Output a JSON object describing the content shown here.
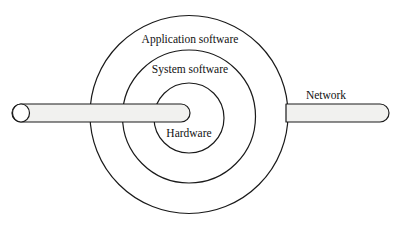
{
  "figure": {
    "type": "concentric-layer-diagram",
    "background_color": "#ffffff",
    "stroke_color": "#1a1a1a",
    "pipe_fill_color": "#f1f1ef"
  },
  "labels": {
    "outer_ring": "Application software",
    "middle_ring": "System software",
    "inner_ring": "Hardware",
    "network": "Network"
  },
  "rings": [
    {
      "name": "application-software",
      "label": "Application software",
      "cx": 189,
      "cy": 114.5,
      "r": 99
    },
    {
      "name": "system-software",
      "label": "System software",
      "cx": 189,
      "cy": 116.5,
      "r": 66.5
    },
    {
      "name": "hardware",
      "label": "Hardware",
      "cx": 189,
      "cy": 118,
      "r": 35
    }
  ],
  "connectors": [
    {
      "name": "left-network-pipe",
      "x_start": 13,
      "x_end": 190,
      "y_top": 104,
      "y_bottom": 122,
      "left_end": "open-cylinder",
      "right_end": "rounded"
    },
    {
      "name": "right-network-pipe",
      "x_start": 286,
      "x_end": 389,
      "y_top": 104,
      "y_bottom": 122,
      "left_end": "flat",
      "right_end": "rounded"
    }
  ],
  "label_positions": {
    "outer_ring": {
      "x": 190,
      "y": 43
    },
    "middle_ring": {
      "x": 190,
      "y": 73
    },
    "inner_ring": {
      "x": 189,
      "y": 137
    },
    "network": {
      "x": 326,
      "y": 99
    }
  }
}
